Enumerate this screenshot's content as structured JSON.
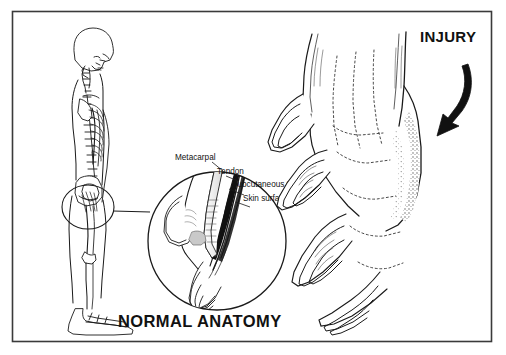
{
  "figure": {
    "background_color": "#ffffff",
    "border_color": "#3a3a3a",
    "ink_color": "#111111",
    "title_injury": "INJURY",
    "caption_normal_anatomy": "NORMAL ANATOMY"
  },
  "labels": {
    "metacarpal": "Metacarpal",
    "tendon": "Tendon",
    "subcutaneous_tissue": "Subcutaneous  tissue",
    "skin_surface": "Skin surface"
  },
  "panels": {
    "left": {
      "name": "normal-anatomy-panel",
      "skeleton_view": "lateral standing skeleton",
      "magnifier": "circular inset of hand at hip showing finger cross-section"
    },
    "right": {
      "name": "injury-panel",
      "hand_view": "dorsum of hand with dotted extensor tendons",
      "injury_marking": "stippled swelling over dorsum",
      "arrow": "curved arrow pointing to injury site"
    }
  }
}
